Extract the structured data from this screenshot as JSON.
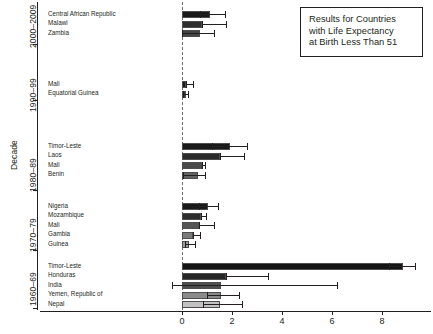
{
  "chart_data": {
    "type": "bar",
    "orientation": "horizontal",
    "title": "",
    "xlabel": "",
    "ylabel": "Decade",
    "xlim": [
      -0.35,
      9.8
    ],
    "xticks": [
      0,
      2,
      4,
      6,
      8
    ],
    "xticklabels": [
      "0",
      "2",
      "4",
      "6",
      "8"
    ],
    "grid": false,
    "zero_reference_line": 0,
    "legend_position": "top-right",
    "annotation": {
      "lines": [
        "Results for Countries",
        "with Life Expectancy",
        "at Birth Less Than 51"
      ]
    },
    "group_labels": [
      "2000–2009",
      "1990–99",
      "1980–89",
      "1970–79",
      "1960–69"
    ],
    "groups": [
      {
        "decade": "2000–2009",
        "bars": [
          {
            "label": "Central African Republic",
            "value": 1.1,
            "ci_low": 0.72,
            "ci_high": 1.72,
            "shade": "#1a1a1a"
          },
          {
            "label": "Malawi",
            "value": 0.8,
            "ci_low": 0.8,
            "ci_high": 1.76,
            "shade": "#2e2e2e"
          },
          {
            "label": "Zambia",
            "value": 0.72,
            "ci_low": 0.0,
            "ci_high": 1.28,
            "shade": "#454545"
          }
        ]
      },
      {
        "decade": "1990–99",
        "bars": [
          {
            "label": "Mali",
            "value": 0.14,
            "ci_low": 0.14,
            "ci_high": 0.42,
            "shade": "#1a1a1a"
          },
          {
            "label": "Equatorial Guinea",
            "value": 0.16,
            "ci_low": 0.05,
            "ci_high": 0.24,
            "shade": "#3a3a3a"
          }
        ]
      },
      {
        "decade": "1980–89",
        "bars": [
          {
            "label": "Timor-Leste",
            "value": 1.9,
            "ci_low": 1.2,
            "ci_high": 2.6,
            "shade": "#1a1a1a"
          },
          {
            "label": "Laos",
            "value": 1.52,
            "ci_low": 1.52,
            "ci_high": 2.46,
            "shade": "#2b2b2b"
          },
          {
            "label": "Mali",
            "value": 0.78,
            "ci_low": 0.78,
            "ci_high": 0.92,
            "shade": "#4a4a4a"
          },
          {
            "label": "Benin",
            "value": 0.62,
            "ci_low": 0.02,
            "ci_high": 0.92,
            "shade": "#636363"
          }
        ]
      },
      {
        "decade": "1970–79",
        "bars": [
          {
            "label": "Nigeria",
            "value": 1.02,
            "ci_low": 0.66,
            "ci_high": 1.42,
            "shade": "#1a1a1a"
          },
          {
            "label": "Mozambique",
            "value": 0.74,
            "ci_low": 0.74,
            "ci_high": 0.96,
            "shade": "#2e2e2e"
          },
          {
            "label": "Mali",
            "value": 0.68,
            "ci_low": 0.68,
            "ci_high": 1.26,
            "shade": "#555555"
          },
          {
            "label": "Gambia",
            "value": 0.44,
            "ci_low": 0.44,
            "ci_high": 0.72,
            "shade": "#7a7a7a"
          },
          {
            "label": "Guinea",
            "value": 0.28,
            "ci_low": 0.12,
            "ci_high": 0.5,
            "shade": "#9c9c9c"
          }
        ]
      },
      {
        "decade": "1960–69",
        "bars": [
          {
            "label": "Timor-Leste",
            "value": 8.82,
            "ci_low": 8.28,
            "ci_high": 9.32,
            "shade": "#141414"
          },
          {
            "label": "Honduras",
            "value": 1.74,
            "ci_low": 1.74,
            "ci_high": 3.42,
            "shade": "#272727"
          },
          {
            "label": "India",
            "value": 1.56,
            "ci_low": -0.4,
            "ci_high": 6.2,
            "shade": "#4f4f4f"
          },
          {
            "label": "Yemen, Republic of",
            "value": 1.54,
            "ci_low": 1.0,
            "ci_high": 2.28,
            "shade": "#8a8a8a"
          },
          {
            "label": "Nepal",
            "value": 1.5,
            "ci_low": 0.84,
            "ci_high": 2.4,
            "shade": "#c2c2c2"
          }
        ]
      }
    ]
  }
}
